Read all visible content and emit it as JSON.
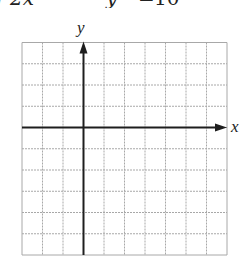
{
  "equation_fragment": {
    "parts": [
      {
        "text": "r",
        "x": -4
      },
      {
        "text": "2x",
        "x": 10
      },
      {
        "text": "y",
        "x": 106
      },
      {
        "text": "=",
        "x": 138
      },
      {
        "text": "10",
        "x": 154
      }
    ],
    "note": "top of image cropped; only lower portion of equation text visible"
  },
  "graph": {
    "x_label": "x",
    "y_label": "y",
    "grid": {
      "left": 22,
      "top": 42.5,
      "right": 227,
      "bottom": 255,
      "cols": 10,
      "rows": 10,
      "line_color": "#a8a8a8",
      "axis_color": "#1e1e1e"
    },
    "origin": {
      "col": 3,
      "row": 4
    },
    "x_axis_arrow": "right",
    "y_axis_arrow": "up"
  },
  "chart_data": {
    "type": "scatter",
    "title": "",
    "xlabel": "x",
    "ylabel": "y",
    "grid": true,
    "series": [],
    "x_gridlines": 10,
    "y_gridlines": 10,
    "note": "blank coordinate grid with x and y axes, no plotted data"
  }
}
